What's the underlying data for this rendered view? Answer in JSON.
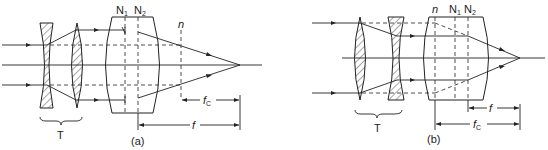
{
  "figure": {
    "panel_a": {
      "caption": "(a)",
      "telescope_label": "T",
      "node1": "N",
      "node1_sub": "1",
      "node2": "N",
      "node2_sub": "2",
      "plane_label": "n",
      "fc_label": "f",
      "fc_sub": "C",
      "f_label": "f"
    },
    "panel_b": {
      "caption": "(b)",
      "telescope_label": "T",
      "plane_label": "n",
      "node1": "N",
      "node1_sub": "1",
      "node2": "N",
      "node2_sub": "2",
      "f_label": "f",
      "fc_label": "f",
      "fc_sub": "C"
    }
  }
}
